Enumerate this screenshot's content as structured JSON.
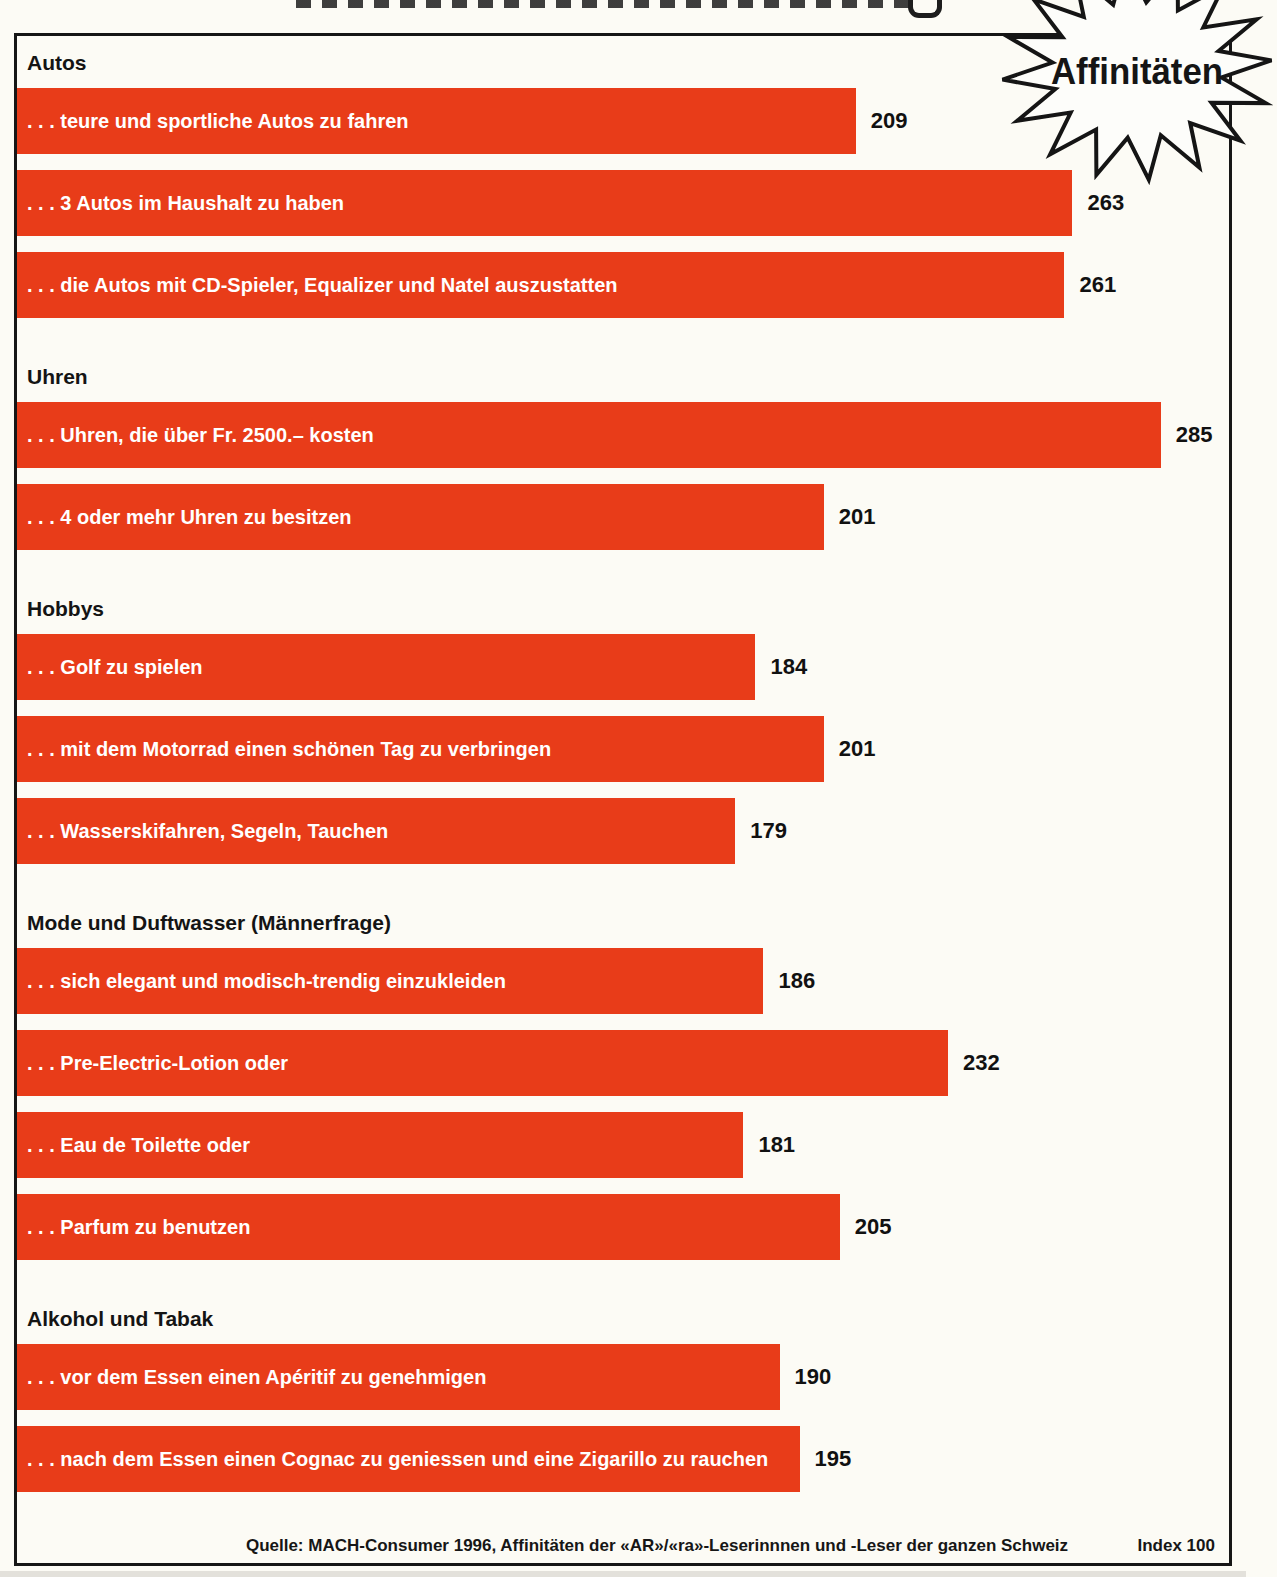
{
  "badge": {
    "label": "Affinitäten"
  },
  "colors": {
    "bar": "#e83c19",
    "bar_text": "#ffffff",
    "ink": "#161616",
    "background": "#fcfbf5"
  },
  "footer": {
    "source": "Quelle: MACH-Consumer 1996, Affinitäten der «AR»/«ra»-Leserinnnen und -Leser der ganzen Schweiz",
    "index_note": "Index 100"
  },
  "chart_data": {
    "type": "bar",
    "orientation": "horizontal",
    "xlim": [
      0,
      302
    ],
    "grid": false,
    "legend": false,
    "value_labels": "right of bar",
    "badge_title": "Affinitäten",
    "index_baseline_note": "Index 100",
    "sections": [
      {
        "title": "Autos",
        "bars": [
          {
            "label": ". . . teure und sportliche Autos zu fahren",
            "value": 209
          },
          {
            "label": ". . . 3 Autos im Haushalt zu haben",
            "value": 263
          },
          {
            "label": ". . . die Autos mit CD-Spieler, Equalizer und Natel auszustatten",
            "value": 261
          }
        ]
      },
      {
        "title": "Uhren",
        "bars": [
          {
            "label": ". . . Uhren, die über Fr. 2500.– kosten",
            "value": 285
          },
          {
            "label": ". . . 4 oder mehr Uhren zu besitzen",
            "value": 201
          }
        ]
      },
      {
        "title": "Hobbys",
        "bars": [
          {
            "label": ". . . Golf zu spielen",
            "value": 184
          },
          {
            "label": ". . . mit dem Motorrad einen schönen Tag zu verbringen",
            "value": 201
          },
          {
            "label": ". . . Wasserskifahren, Segeln, Tauchen",
            "value": 179
          }
        ]
      },
      {
        "title": "Mode und Duftwasser (Männerfrage)",
        "bars": [
          {
            "label": ". . . sich elegant und modisch-trendig einzukleiden",
            "value": 186
          },
          {
            "label": ". . . Pre-Electric-Lotion oder",
            "value": 232
          },
          {
            "label": ". . . Eau de Toilette oder",
            "value": 181
          },
          {
            "label": ". . . Parfum zu benutzen",
            "value": 205
          }
        ]
      },
      {
        "title": "Alkohol und Tabak",
        "bars": [
          {
            "label": ". . . vor dem Essen einen Apéritif zu genehmigen",
            "value": 190
          },
          {
            "label": ". . . nach dem Essen einen Cognac zu geniessen und eine Zigarillo zu rauchen",
            "value": 195
          }
        ]
      }
    ]
  }
}
